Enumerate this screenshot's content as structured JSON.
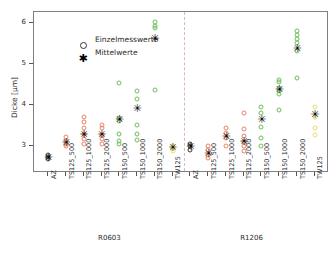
{
  "chart_data": {
    "type": "scatter",
    "title": "",
    "xlabel": "",
    "ylabel": "Dicke [µm]",
    "ylim": [
      2.35,
      6.28
    ],
    "yticks": [
      3,
      4,
      5,
      6
    ],
    "ytick_labels": [
      "3",
      "4",
      "5",
      "6"
    ],
    "grid": false,
    "legend_position": "top-left",
    "legend": [
      {
        "key": "individual",
        "label": "Einzelmesswerte",
        "marker": "open-circle"
      },
      {
        "key": "mean",
        "label": "Mittelwerte",
        "marker": "star"
      }
    ],
    "panel_divider": true,
    "groups": [
      {
        "name": "R0603",
        "categories": [
          {
            "label": "AZ",
            "color": "#3c3c3c",
            "individual": [
              2.7,
              2.74,
              2.78
            ],
            "mean": 2.74
          },
          {
            "label": "TS125_500",
            "color": "#e8836b",
            "individual": [
              3.0,
              3.07,
              3.12,
              3.22
            ],
            "mean": 3.1
          },
          {
            "label": "TS125_1000",
            "color": "#e8836b",
            "individual": [
              3.05,
              3.18,
              3.3,
              3.45,
              3.6,
              3.72
            ],
            "mean": 3.31
          },
          {
            "label": "TS125_2000",
            "color": "#e8836b",
            "individual": [
              3.05,
              3.18,
              3.28,
              3.46,
              3.52
            ],
            "mean": 3.3
          },
          {
            "label": "TS150_500",
            "color": "#6cbf5a",
            "individual": [
              3.05,
              3.12,
              3.3,
              3.62,
              3.7,
              4.55
            ],
            "mean": 3.68
          },
          {
            "label": "TS150_1000",
            "color": "#6cbf5a",
            "individual": [
              3.15,
              3.3,
              3.52,
              4.15,
              4.35
            ],
            "mean": 3.94
          },
          {
            "label": "TS150_2000",
            "color": "#6cbf5a",
            "individual": [
              4.38,
              5.88,
              5.95,
              6.03
            ],
            "mean": 5.65
          },
          {
            "label": "TW125",
            "color": "#e8e06a",
            "individual": [
              2.88,
              2.96,
              3.02
            ],
            "mean": 2.98
          }
        ]
      },
      {
        "name": "R1206",
        "categories": [
          {
            "label": "AZ",
            "color": "#3c3c3c",
            "individual": [
              2.92,
              3.0,
              3.05
            ],
            "mean": 3.0
          },
          {
            "label": "TS125_500",
            "color": "#e8836b",
            "individual": [
              2.72,
              2.8,
              2.92,
              3.0
            ],
            "mean": 2.85
          },
          {
            "label": "TS125_1000",
            "color": "#e8836b",
            "individual": [
              3.02,
              3.2,
              3.32,
              3.45
            ],
            "mean": 3.25
          },
          {
            "label": "TS125_2000",
            "color": "#e8836b",
            "individual": [
              2.88,
              3.0,
              3.1,
              3.26,
              3.42,
              3.82
            ],
            "mean": 3.12
          },
          {
            "label": "TS150_500",
            "color": "#6cbf5a",
            "individual": [
              3.02,
              3.2,
              3.48,
              3.82,
              3.95
            ],
            "mean": 3.66
          },
          {
            "label": "TS150_1000",
            "color": "#6cbf5a",
            "individual": [
              3.88,
              4.28,
              4.35,
              4.42,
              4.58,
              4.62
            ],
            "mean": 4.4
          },
          {
            "label": "TS150_2000",
            "color": "#6cbf5a",
            "individual": [
              4.68,
              5.32,
              5.52,
              5.62,
              5.72,
              5.82
            ],
            "mean": 5.4
          },
          {
            "label": "TW125",
            "color": "#e8e06a",
            "individual": [
              3.28,
              3.45,
              3.72,
              3.95
            ],
            "mean": 3.78
          }
        ]
      }
    ]
  }
}
